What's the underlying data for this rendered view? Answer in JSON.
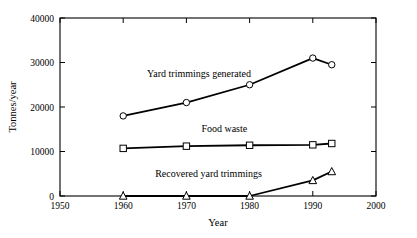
{
  "chart_data": {
    "type": "line",
    "title": "",
    "xlabel": "Year",
    "ylabel": "Tonnes/year",
    "xlim": [
      1950,
      2000
    ],
    "ylim": [
      0,
      40000
    ],
    "xticks": [
      1950,
      1960,
      1970,
      1980,
      1990,
      2000
    ],
    "xtick_labels": [
      "1950",
      "1960",
      "1970",
      "1980",
      "1990",
      "2000"
    ],
    "yticks": [
      0,
      10000,
      20000,
      30000,
      40000
    ],
    "ytick_labels": [
      "0",
      "10000",
      "20000",
      "30000",
      "40000"
    ],
    "grid": false,
    "legend_position": "inline-annotations",
    "line_color": "#000000",
    "marker_fill": "#ffffff",
    "series": [
      {
        "name": "Yard trimmings generated",
        "marker": "circle",
        "label_x": 1972.0,
        "label_y": 26800,
        "x": [
          1960,
          1970,
          1980,
          1990,
          1993
        ],
        "values": [
          18000,
          21000,
          25000,
          31000,
          29500
        ]
      },
      {
        "name": "Food waste",
        "marker": "square",
        "label_x": 1976.0,
        "label_y": 14400,
        "x": [
          1960,
          1970,
          1980,
          1990,
          1993
        ],
        "values": [
          10700,
          11200,
          11400,
          11500,
          11800
        ]
      },
      {
        "name": "Recovered yard trimmings",
        "marker": "triangle",
        "label_x": 1973.5,
        "label_y": 4200,
        "x": [
          1960,
          1970,
          1980,
          1990,
          1993
        ],
        "values": [
          0,
          0,
          0,
          3500,
          5500
        ]
      }
    ]
  }
}
